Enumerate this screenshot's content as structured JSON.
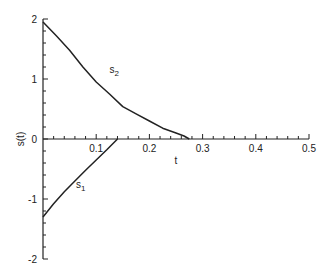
{
  "chart_data": {
    "type": "line",
    "title": "",
    "xlabel": "t",
    "ylabel": "s(t)",
    "xlim": [
      0,
      0.5
    ],
    "ylim": [
      -2,
      2
    ],
    "x_ticks": [
      0.1,
      0.2,
      0.3,
      0.4,
      0.5
    ],
    "x_tick_labels": [
      "0.1",
      "0.2",
      "0.3",
      "0.4",
      "0.5"
    ],
    "y_ticks": [
      -2,
      -1,
      0,
      1,
      2
    ],
    "y_tick_labels": [
      "-2",
      "-1",
      "0",
      "1",
      "2"
    ],
    "grid": false,
    "series": [
      {
        "name": "s2",
        "label_main": "s",
        "label_sub": "2",
        "label_pos": [
          0.125,
          1.1
        ],
        "x": [
          0,
          0.025,
          0.05,
          0.075,
          0.1,
          0.125,
          0.15,
          0.175,
          0.2,
          0.225,
          0.25,
          0.265,
          0.275
        ],
        "y": [
          1.95,
          1.72,
          1.48,
          1.2,
          0.95,
          0.75,
          0.54,
          0.42,
          0.3,
          0.18,
          0.1,
          0.05,
          0.0
        ]
      },
      {
        "name": "s1",
        "label_main": "s",
        "label_sub": "1",
        "label_pos": [
          0.062,
          -0.82
        ],
        "x": [
          0,
          0.02,
          0.04,
          0.06,
          0.08,
          0.1,
          0.12,
          0.14
        ],
        "y": [
          -1.3,
          -1.08,
          -0.88,
          -0.7,
          -0.52,
          -0.35,
          -0.18,
          0.0
        ]
      }
    ]
  }
}
